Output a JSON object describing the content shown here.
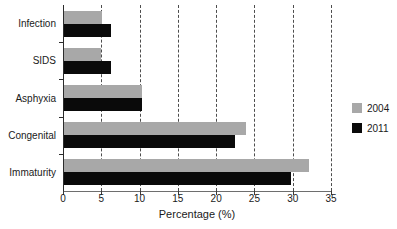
{
  "chart_data": {
    "type": "bar",
    "orientation": "horizontal",
    "title": "",
    "xlabel": "Percentage (%)",
    "ylabel": "",
    "xlim": [
      0,
      35
    ],
    "xticks": [
      0,
      5,
      10,
      15,
      20,
      25,
      30,
      35
    ],
    "xticklabels": [
      "0",
      "5",
      "10",
      "15",
      "20",
      "25",
      "30",
      "35"
    ],
    "grid": "vertical-dashed",
    "legend_position": "right",
    "categories": [
      "Infection",
      "SIDS",
      "Asphyxia",
      "Congenital",
      "Immaturity"
    ],
    "series": [
      {
        "name": "2004",
        "color": "#a8a8a8",
        "values": [
          5.0,
          4.8,
          10.2,
          23.8,
          32.0
        ]
      },
      {
        "name": "2011",
        "color": "#0a0a0a",
        "values": [
          6.2,
          6.2,
          10.2,
          22.3,
          29.7
        ]
      }
    ]
  },
  "legend": {
    "items": [
      {
        "label": "2004",
        "color": "#a8a8a8"
      },
      {
        "label": "2011",
        "color": "#0a0a0a"
      }
    ]
  }
}
